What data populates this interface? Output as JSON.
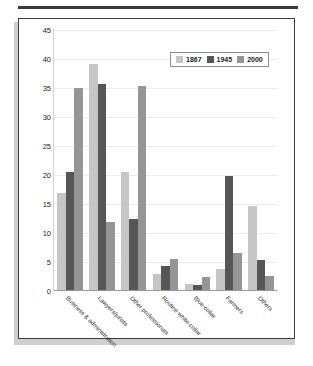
{
  "page": {
    "top_rule_color": "#3a3a3a",
    "panel_border_color": "#3b3b3b",
    "background_color": "#ffffff"
  },
  "legend": {
    "position": "top-right",
    "items": [
      {
        "label": "1867",
        "color": "#c6c6c6"
      },
      {
        "label": "1945",
        "color": "#565656"
      },
      {
        "label": "2000",
        "color": "#959595"
      }
    ]
  },
  "chart_data": {
    "type": "bar",
    "title": "",
    "xlabel": "",
    "ylabel": "",
    "ylim": [
      0,
      45
    ],
    "yticks": [
      0,
      5,
      10,
      15,
      20,
      25,
      30,
      35,
      40,
      45
    ],
    "grid": true,
    "legend_position": "top-right",
    "categories": [
      "Business & administration",
      "Lawyers/jurists",
      "Other professionals",
      "Routine white-collar",
      "Blue-collar",
      "Farmers",
      "Others"
    ],
    "series": [
      {
        "name": "1867",
        "color": "#c6c6c6",
        "values": [
          16.7,
          39.0,
          20.4,
          2.8,
          1.1,
          3.6,
          14.5
        ]
      },
      {
        "name": "1945",
        "color": "#565656",
        "values": [
          20.3,
          35.6,
          12.3,
          4.2,
          0.9,
          19.7,
          5.1
        ]
      },
      {
        "name": "2000",
        "color": "#959595",
        "values": [
          34.8,
          11.7,
          35.1,
          5.3,
          2.3,
          6.4,
          2.5
        ]
      }
    ]
  }
}
